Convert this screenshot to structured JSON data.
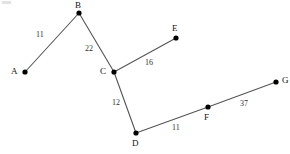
{
  "diagram": {
    "type": "node-link-graph",
    "title": "",
    "width": 290,
    "height": 154,
    "background_color": "#ffffff",
    "edge_color": "#555555",
    "node_color": "#000000",
    "node_label_color": "#111111",
    "edge_label_color": "#333333",
    "nodes": [
      {
        "id": "A",
        "label": "A",
        "x": 25,
        "y": 72,
        "label_x": 11,
        "label_y": 67,
        "r": 2.6
      },
      {
        "id": "B",
        "label": "B",
        "x": 79,
        "y": 13,
        "label_x": 75,
        "label_y": 1,
        "r": 2.6
      },
      {
        "id": "C",
        "label": "C",
        "x": 114,
        "y": 72,
        "label_x": 100,
        "label_y": 67,
        "r": 2.6
      },
      {
        "id": "E",
        "label": "E",
        "x": 176,
        "y": 38,
        "label_x": 172,
        "label_y": 24,
        "r": 2.6
      },
      {
        "id": "D",
        "label": "D",
        "x": 136,
        "y": 133,
        "label_x": 132,
        "label_y": 139,
        "r": 2.6
      },
      {
        "id": "F",
        "label": "F",
        "x": 208,
        "y": 107,
        "label_x": 204,
        "label_y": 113,
        "r": 2.6
      },
      {
        "id": "G",
        "label": "G",
        "x": 276,
        "y": 82,
        "label_x": 282,
        "label_y": 76,
        "r": 2.6
      }
    ],
    "edges": [
      {
        "id": "A-B",
        "from": "A",
        "to": "B",
        "weight": "11",
        "label_x": 36,
        "label_y": 31
      },
      {
        "id": "B-C",
        "from": "B",
        "to": "C",
        "weight": "22",
        "label_x": 85,
        "label_y": 45
      },
      {
        "id": "C-E",
        "from": "C",
        "to": "E",
        "weight": "16",
        "label_x": 145,
        "label_y": 59
      },
      {
        "id": "C-D",
        "from": "C",
        "to": "D",
        "weight": "12",
        "label_x": 112,
        "label_y": 99
      },
      {
        "id": "D-F",
        "from": "D",
        "to": "F",
        "weight": "11",
        "label_x": 172,
        "label_y": 124
      },
      {
        "id": "F-G",
        "from": "F",
        "to": "G",
        "weight": "37",
        "label_x": 240,
        "label_y": 100
      }
    ]
  }
}
